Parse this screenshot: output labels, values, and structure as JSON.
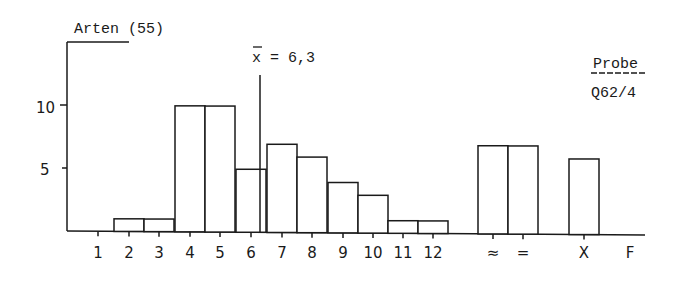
{
  "chart_data": {
    "type": "bar",
    "title": "Arten (55)",
    "xlabel": "",
    "ylabel": "Arten",
    "ylim": [
      0,
      13
    ],
    "yticks": [
      5,
      10
    ],
    "categories": [
      "1",
      "2",
      "3",
      "4",
      "5",
      "6",
      "7",
      "8",
      "9",
      "10",
      "11",
      "12",
      "≈",
      "=",
      "X",
      "F"
    ],
    "values": [
      0,
      1,
      1,
      10,
      10,
      5,
      7,
      6,
      4,
      3,
      1,
      1,
      7,
      7,
      6,
      0
    ],
    "grid": false,
    "legend": null,
    "annotations": [
      {
        "text": "x̄ = 6,3",
        "x": 6.3,
        "type": "vertical-line"
      },
      {
        "text": "Probe",
        "position": "top-right",
        "underlined": true
      },
      {
        "text": "Q62/4",
        "position": "top-right"
      }
    ]
  },
  "labels": {
    "title": "Arten (55)",
    "mean_prefix": "x",
    "mean_rest": " = 6,3",
    "probe": "Probe",
    "sample_id": "Q62/4",
    "y10": "10",
    "y5": "5"
  }
}
